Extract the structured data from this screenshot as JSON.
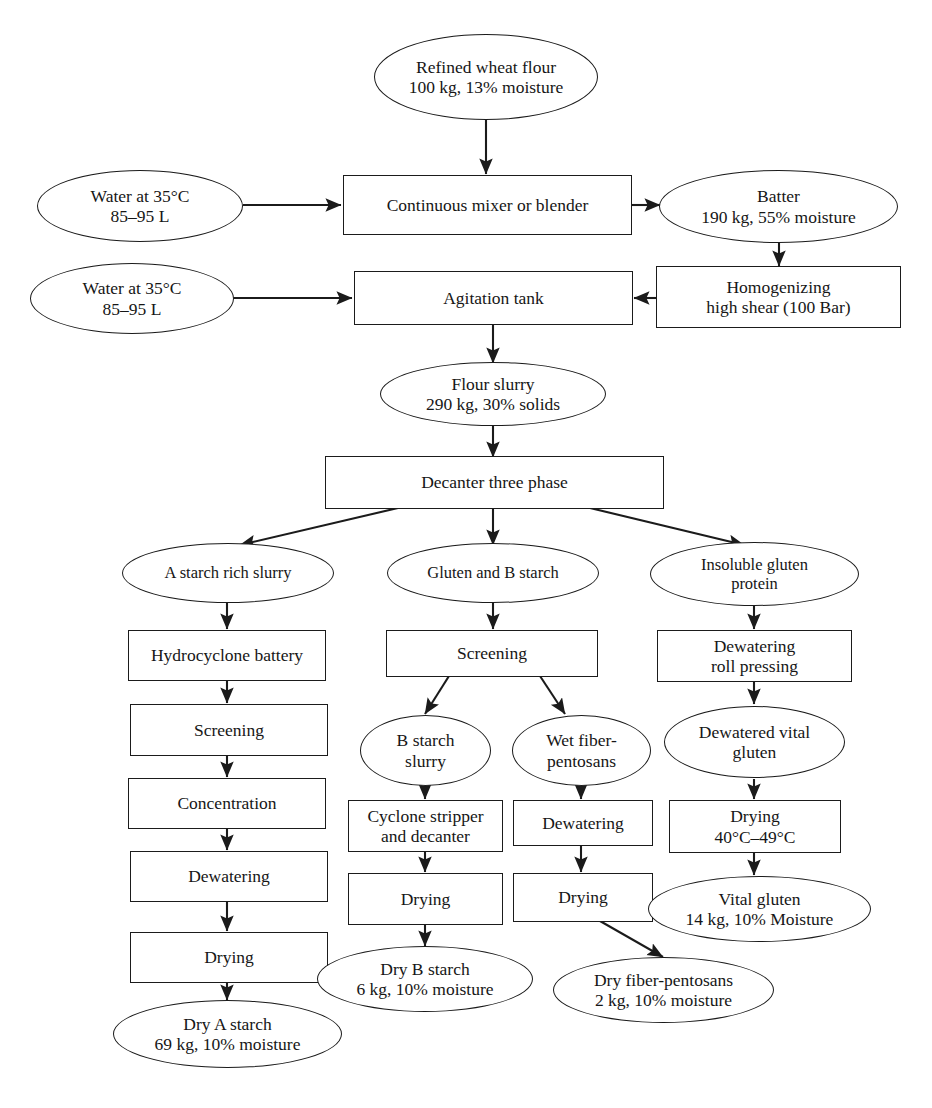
{
  "diagram": {
    "background_color": "#ffffff",
    "line_color": "#1b1b1b",
    "text_color": "#161616"
  },
  "nodes": {
    "refined_wheat_flour": {
      "label": "Refined wheat flour\n100 kg, 13% moisture",
      "shape": "ellipse"
    },
    "water_1": {
      "label": "Water at 35°C\n85–95 L",
      "shape": "ellipse"
    },
    "continuous_mixer": {
      "label": "Continuous mixer or blender",
      "shape": "box"
    },
    "batter": {
      "label": "Batter\n190 kg, 55% moisture",
      "shape": "ellipse"
    },
    "water_2": {
      "label": "Water at 35°C\n85–95 L",
      "shape": "ellipse"
    },
    "agitation_tank": {
      "label": "Agitation tank",
      "shape": "box"
    },
    "homogenizing": {
      "label": "Homogenizing\nhigh shear (100 Bar)",
      "shape": "box"
    },
    "flour_slurry": {
      "label": "Flour slurry\n290 kg, 30% solids",
      "shape": "ellipse"
    },
    "decanter": {
      "label": "Decanter three phase",
      "shape": "box"
    },
    "a_starch_rich_slurry": {
      "label": "A starch rich slurry",
      "shape": "ellipse"
    },
    "gluten_and_b_starch": {
      "label": "Gluten and B starch",
      "shape": "ellipse"
    },
    "insoluble_gluten_protein": {
      "label": "Insoluble gluten\nprotein",
      "shape": "ellipse"
    },
    "hydrocyclone_battery": {
      "label": "Hydrocyclone battery",
      "shape": "box"
    },
    "screening_left": {
      "label": "Screening",
      "shape": "box"
    },
    "concentration": {
      "label": "Concentration",
      "shape": "box"
    },
    "dewatering_left": {
      "label": "Dewatering",
      "shape": "box"
    },
    "drying_left": {
      "label": "Drying",
      "shape": "box"
    },
    "dry_a_starch": {
      "label": "Dry A starch\n69 kg, 10% moisture",
      "shape": "ellipse"
    },
    "screening_mid": {
      "label": "Screening",
      "shape": "box"
    },
    "b_starch_slurry": {
      "label": "B starch\nslurry",
      "shape": "ellipse"
    },
    "wet_fiber_pentosans": {
      "label": "Wet fiber-\npentosans",
      "shape": "ellipse"
    },
    "cyclone_stripper": {
      "label": "Cyclone stripper\nand decanter",
      "shape": "box"
    },
    "dewatering_mid": {
      "label": "Dewatering",
      "shape": "box"
    },
    "drying_mid_b": {
      "label": "Drying",
      "shape": "box"
    },
    "drying_mid_fiber": {
      "label": "Drying",
      "shape": "box"
    },
    "dry_b_starch": {
      "label": "Dry B starch\n6 kg, 10% moisture",
      "shape": "ellipse"
    },
    "dry_fiber_pentosans": {
      "label": "Dry fiber-pentosans\n2 kg, 10% moisture",
      "shape": "ellipse"
    },
    "dewatering_roll_pressing": {
      "label": "Dewatering\nroll pressing",
      "shape": "box"
    },
    "dewatered_vital_gluten": {
      "label": "Dewatered vital\ngluten",
      "shape": "ellipse"
    },
    "drying_right": {
      "label": "Drying\n40°C–49°C",
      "shape": "box"
    },
    "vital_gluten": {
      "label": "Vital gluten\n14 kg, 10% Moisture",
      "shape": "ellipse"
    }
  },
  "edges": [
    {
      "from": "refined_wheat_flour",
      "to": "continuous_mixer"
    },
    {
      "from": "water_1",
      "to": "continuous_mixer"
    },
    {
      "from": "continuous_mixer",
      "to": "batter"
    },
    {
      "from": "batter",
      "to": "homogenizing"
    },
    {
      "from": "homogenizing",
      "to": "agitation_tank"
    },
    {
      "from": "water_2",
      "to": "agitation_tank"
    },
    {
      "from": "agitation_tank",
      "to": "flour_slurry"
    },
    {
      "from": "flour_slurry",
      "to": "decanter"
    },
    {
      "from": "decanter",
      "to": "a_starch_rich_slurry"
    },
    {
      "from": "decanter",
      "to": "gluten_and_b_starch"
    },
    {
      "from": "decanter",
      "to": "insoluble_gluten_protein"
    },
    {
      "from": "a_starch_rich_slurry",
      "to": "hydrocyclone_battery"
    },
    {
      "from": "hydrocyclone_battery",
      "to": "screening_left"
    },
    {
      "from": "screening_left",
      "to": "concentration"
    },
    {
      "from": "concentration",
      "to": "dewatering_left"
    },
    {
      "from": "dewatering_left",
      "to": "drying_left"
    },
    {
      "from": "drying_left",
      "to": "dry_a_starch"
    },
    {
      "from": "gluten_and_b_starch",
      "to": "screening_mid"
    },
    {
      "from": "screening_mid",
      "to": "b_starch_slurry"
    },
    {
      "from": "screening_mid",
      "to": "wet_fiber_pentosans"
    },
    {
      "from": "b_starch_slurry",
      "to": "cyclone_stripper"
    },
    {
      "from": "cyclone_stripper",
      "to": "drying_mid_b"
    },
    {
      "from": "drying_mid_b",
      "to": "dry_b_starch"
    },
    {
      "from": "wet_fiber_pentosans",
      "to": "dewatering_mid"
    },
    {
      "from": "dewatering_mid",
      "to": "drying_mid_fiber"
    },
    {
      "from": "drying_mid_fiber",
      "to": "dry_fiber_pentosans"
    },
    {
      "from": "insoluble_gluten_protein",
      "to": "dewatering_roll_pressing"
    },
    {
      "from": "dewatering_roll_pressing",
      "to": "dewatered_vital_gluten"
    },
    {
      "from": "dewatered_vital_gluten",
      "to": "drying_right"
    },
    {
      "from": "drying_right",
      "to": "vital_gluten"
    }
  ]
}
